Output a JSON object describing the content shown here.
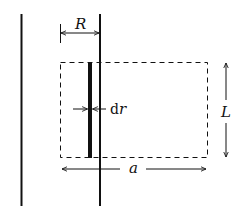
{
  "diagram": {
    "labels": {
      "R": "R",
      "dr_d": "d",
      "dr_r": "r",
      "L": "L",
      "a": "a"
    },
    "colors": {
      "stroke": "#111111",
      "background": "#ffffff"
    }
  }
}
